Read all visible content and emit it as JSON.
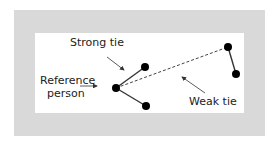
{
  "diagram": {
    "labels": {
      "strong_tie": "Strong tie",
      "reference_line1": "Reference",
      "reference_line2": "person",
      "weak_tie": "Weak tie"
    },
    "colors": {
      "outer_frame": "#d9d9d9",
      "inner_panel": "#ffffff",
      "node": "#000000",
      "edge": "#333333"
    },
    "nodes": [
      {
        "id": "reference",
        "x": 116,
        "y": 88
      },
      {
        "id": "strong-a",
        "x": 145,
        "y": 67
      },
      {
        "id": "strong-b",
        "x": 146,
        "y": 106
      },
      {
        "id": "weak-a",
        "x": 228,
        "y": 47
      },
      {
        "id": "weak-b",
        "x": 236,
        "y": 74
      }
    ],
    "edges": [
      {
        "from": "reference",
        "to": "strong-a",
        "type": "strong"
      },
      {
        "from": "reference",
        "to": "strong-b",
        "type": "strong"
      },
      {
        "from": "weak-a",
        "to": "weak-b",
        "type": "strong"
      },
      {
        "from": "reference",
        "to": "weak-a",
        "type": "weak"
      }
    ]
  }
}
